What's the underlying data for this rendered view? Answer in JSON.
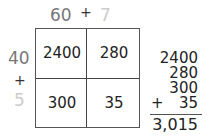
{
  "top_labels": {
    "tens": "60",
    "plus": "+",
    "ones": "7"
  },
  "side_labels": {
    "tens": "40",
    "plus": "+",
    "ones": "5"
  },
  "grid": {
    "cells": [
      [
        "2400",
        "280"
      ],
      [
        "300",
        "35"
      ]
    ]
  },
  "addition": {
    "addends": [
      "2400",
      "280",
      "300",
      "35"
    ],
    "plus_sign": "+",
    "total": "3,015"
  },
  "colors": {
    "tens_label": "#777777",
    "ones_label": "#cccccc",
    "text": "#222222",
    "lines": "#444444"
  }
}
